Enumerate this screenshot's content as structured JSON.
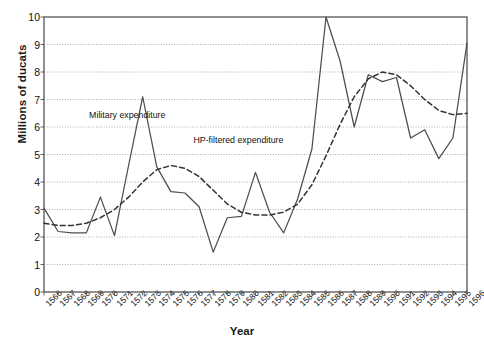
{
  "chart_data": {
    "type": "line",
    "title": "",
    "xlabel": "Year",
    "ylabel": "Millions of ducats",
    "ylim": [
      0,
      10
    ],
    "ytick_values": [
      0,
      1,
      2,
      3,
      4,
      5,
      6,
      7,
      8,
      9,
      10
    ],
    "ytick_labels": [
      "0",
      "1",
      "2",
      "3",
      "4",
      "5",
      "6",
      "7",
      "8",
      "9",
      "10"
    ],
    "grid": "horizontal-dotted",
    "legend_position": "inline-annotations",
    "categories": [
      "1566",
      "1567",
      "1568",
      "1569",
      "1570",
      "1571",
      "1572",
      "1573",
      "1574",
      "1575",
      "1576",
      "1577",
      "1578",
      "1579",
      "1580",
      "1581",
      "1582",
      "1583",
      "1584",
      "1585",
      "1586",
      "1587",
      "1588",
      "1589",
      "1590",
      "1591",
      "1592",
      "1593",
      "1594",
      "1595",
      "1596"
    ],
    "x": [
      1566,
      1567,
      1568,
      1569,
      1570,
      1571,
      1572,
      1573,
      1574,
      1575,
      1576,
      1577,
      1578,
      1579,
      1580,
      1581,
      1582,
      1583,
      1584,
      1585,
      1586,
      1587,
      1588,
      1589,
      1590,
      1591,
      1592,
      1593,
      1594,
      1595,
      1596
    ],
    "series": [
      {
        "name": "Military expenditure",
        "style": "solid",
        "color": "#4d4d4d",
        "values": [
          3.05,
          2.2,
          2.15,
          2.15,
          3.45,
          2.05,
          4.6,
          7.1,
          4.55,
          3.65,
          3.6,
          3.1,
          1.45,
          2.7,
          2.75,
          4.35,
          2.9,
          2.15,
          3.4,
          5.2,
          10.0,
          8.4,
          6.0,
          7.9,
          7.65,
          7.8,
          5.6,
          5.9,
          4.85,
          5.6,
          9.05
        ]
      },
      {
        "name": "HP-filtered expenditure",
        "style": "dashed",
        "color": "#333333",
        "values": [
          2.5,
          2.42,
          2.42,
          2.5,
          2.7,
          3.0,
          3.45,
          4.0,
          4.45,
          4.6,
          4.5,
          4.2,
          3.7,
          3.2,
          2.9,
          2.8,
          2.8,
          2.9,
          3.2,
          3.9,
          4.95,
          6.1,
          7.1,
          7.75,
          8.0,
          7.9,
          7.5,
          7.0,
          6.6,
          6.45,
          6.5
        ]
      }
    ],
    "annotations": [
      {
        "text": "Military expenditure",
        "x": 1569.2,
        "y": 6.4
      },
      {
        "text": "HP-filtered expenditure",
        "x": 1576.6,
        "y": 5.5
      }
    ]
  }
}
